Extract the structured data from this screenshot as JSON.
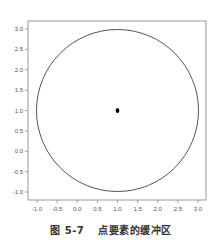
{
  "caption": {
    "figure_number": "图 5-7",
    "title": "点要素的缓冲区"
  },
  "chart_data": {
    "type": "scatter",
    "title": "点要素的缓冲区",
    "xlabel": "",
    "ylabel": "",
    "xlim": [
      -1.25,
      3.2
    ],
    "ylim": [
      -1.2,
      3.2
    ],
    "x_ticks": [
      -1.0,
      -0.5,
      0.0,
      0.5,
      1.0,
      1.5,
      2.0,
      2.5,
      3.0
    ],
    "x_tick_labels": [
      "-1.0",
      "-0.5",
      "0.0",
      "0.5",
      "1.0",
      "1.5",
      "2.0",
      "2.5",
      "3.0"
    ],
    "y_ticks": [
      3.0,
      2.5,
      2.0,
      1.5,
      1.0,
      0.5,
      0.0,
      -0.5,
      -1.0
    ],
    "y_tick_labels": [
      "3.0",
      "2.5",
      "2.0",
      "1.5",
      "1.0",
      "0.5",
      "0.0",
      "-0.5",
      "-1.0"
    ],
    "grid": false,
    "legend": null,
    "points": [
      {
        "x": 1.0,
        "y": 1.0
      }
    ],
    "buffer": {
      "center": [
        1.0,
        1.0
      ],
      "radius": 2.0
    },
    "colors": {
      "axis": "#888888",
      "circle": "#555555",
      "point": "#000000"
    }
  }
}
